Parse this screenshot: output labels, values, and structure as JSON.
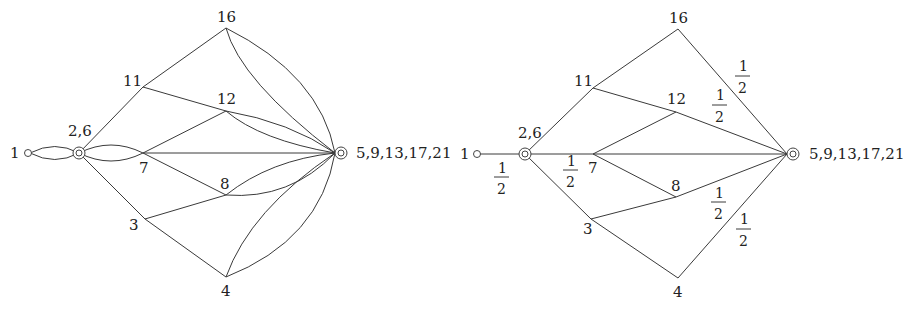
{
  "diagram": {
    "left_graph": {
      "nodes": {
        "n1": "1",
        "n26": "2,6",
        "n7": "7",
        "n11": "11",
        "n16": "16",
        "n12": "12",
        "n8": "8",
        "n3": "3",
        "n4": "4",
        "nsink": "5,9,13,17,21"
      },
      "edges": [
        [
          "1",
          "2,6",
          "double"
        ],
        [
          "2,6",
          "7",
          "double"
        ],
        [
          "2,6",
          "11"
        ],
        [
          "2,6",
          "3"
        ],
        [
          "11",
          "16"
        ],
        [
          "11",
          "5,9,13,17,21"
        ],
        [
          "16",
          "5,9,13,17,21",
          "double"
        ],
        [
          "7",
          "12"
        ],
        [
          "7",
          "8"
        ],
        [
          "7",
          "5,9,13,17,21"
        ],
        [
          "12",
          "5,9,13,17,21"
        ],
        [
          "8",
          "5,9,13,17,21"
        ],
        [
          "3",
          "8"
        ],
        [
          "3",
          "4"
        ],
        [
          "4",
          "5,9,13,17,21",
          "double"
        ]
      ]
    },
    "right_graph": {
      "nodes": {
        "n1": "1",
        "n26": "2,6",
        "n7": "7",
        "n11": "11",
        "n16": "16",
        "n12": "12",
        "n8": "8",
        "n3": "3",
        "n4": "4",
        "nsink": "5,9,13,17,21"
      },
      "weights": {
        "w_1_26": {
          "num": "1",
          "den": "2"
        },
        "w_26_7": {
          "num": "1",
          "den": "2"
        },
        "w_16_sink": {
          "num": "1",
          "den": "2"
        },
        "w_12_sink": {
          "num": "1",
          "den": "2"
        },
        "w_8_sink": {
          "num": "1",
          "den": "2"
        },
        "w_4_sink": {
          "num": "1",
          "den": "2"
        }
      }
    }
  }
}
